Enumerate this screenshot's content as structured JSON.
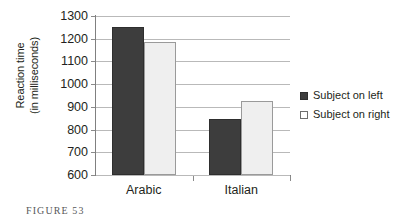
{
  "caption": "FIGURE 53",
  "legend": {
    "position": "right",
    "entries": [
      {
        "label": "Subject on left",
        "swatch": "filled-dark-square-icon"
      },
      {
        "label": "Subject on right",
        "swatch": "outlined-white-square-icon"
      }
    ]
  },
  "chart_data": {
    "type": "bar",
    "title": "",
    "xlabel": "",
    "ylabel": "Reaction time\n(in milliseconds)",
    "ylabel_line1": "Reaction time",
    "ylabel_line2": "(in milliseconds)",
    "categories": [
      "Arabic",
      "Italian"
    ],
    "series": [
      {
        "name": "Subject on left",
        "values": [
          1252,
          848
        ],
        "color": "#3d3d3d"
      },
      {
        "name": "Subject on right",
        "values": [
          1186,
          925
        ],
        "color": "#efefef"
      }
    ],
    "ylim": [
      600,
      1300
    ],
    "ytick_step": 100,
    "yticks": [
      1300,
      1200,
      1100,
      1000,
      900,
      800,
      700,
      600
    ],
    "ytick_labels": [
      "1300",
      "1200",
      "1100",
      "1000",
      "900",
      "800",
      "700",
      "600"
    ],
    "grid": true,
    "grid_axis": "y",
    "legend_position": "right"
  }
}
